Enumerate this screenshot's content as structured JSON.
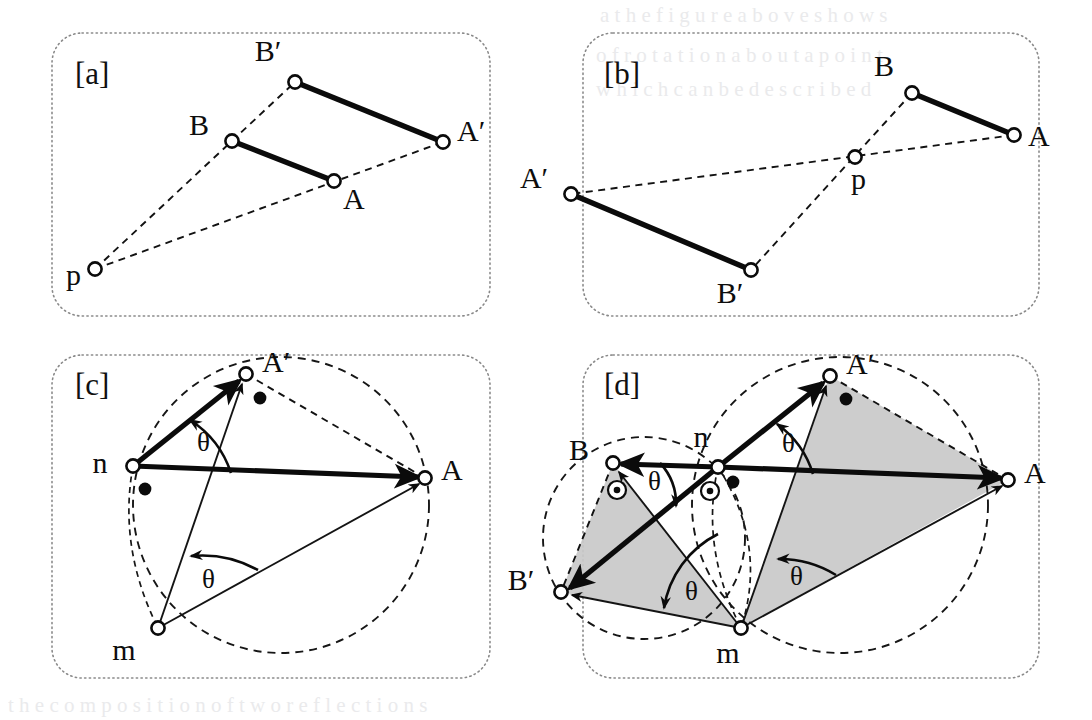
{
  "figure": {
    "canvas": {
      "width": 1092,
      "height": 720,
      "background": "#ffffff"
    },
    "style": {
      "panel_border": "#8a8a8a",
      "stroke": "#0b0b0b",
      "shade_fill": "#c9c9c9",
      "node_fill": "#ffffff"
    }
  },
  "panels": [
    {
      "id": "a",
      "tag": "[a]",
      "tag_pos": {
        "x": 75,
        "y": 84
      },
      "frame": {
        "x": 52,
        "y": 33,
        "w": 438,
        "h": 283,
        "r": 30
      },
      "description": "Central similarity / homothety from point p mapping segment AB to A'B'",
      "points": [
        {
          "name": "B'",
          "label": "B′",
          "x": 295,
          "y": 82,
          "label_x": 268,
          "label_y": 61,
          "marker": "open"
        },
        {
          "name": "B",
          "label": "B",
          "x": 232,
          "y": 141,
          "label_x": 199,
          "label_y": 135,
          "marker": "open"
        },
        {
          "name": "A'",
          "label": "A′",
          "x": 443,
          "y": 142,
          "label_x": 457,
          "label_y": 141,
          "marker": "open"
        },
        {
          "name": "A",
          "label": "A",
          "x": 334,
          "y": 181,
          "label_x": 343,
          "label_y": 209,
          "marker": "open"
        },
        {
          "name": "p",
          "label": "p",
          "x": 95,
          "y": 269,
          "label_x": 66,
          "label_y": 285,
          "marker": "open"
        }
      ],
      "solid_segments": [
        {
          "from": "B'",
          "to": "A'"
        },
        {
          "from": "B",
          "to": "A"
        }
      ],
      "dashed_segments": [
        {
          "from": "p",
          "to": "B'"
        },
        {
          "from": "p",
          "to": "A'"
        }
      ]
    },
    {
      "id": "b",
      "tag": "[b]",
      "tag_pos": {
        "x": 604,
        "y": 84
      },
      "frame": {
        "x": 583,
        "y": 33,
        "w": 456,
        "h": 283,
        "r": 30
      },
      "description": "Point reflection (180 degree rotation) about p mapping AB to A'B'",
      "points": [
        {
          "name": "B",
          "label": "B",
          "x": 912,
          "y": 93,
          "label_x": 884,
          "label_y": 76,
          "marker": "open"
        },
        {
          "name": "A",
          "label": "A",
          "x": 1014,
          "y": 135,
          "label_x": 1028,
          "label_y": 146,
          "marker": "open"
        },
        {
          "name": "p",
          "label": "p",
          "x": 855,
          "y": 157,
          "label_x": 851,
          "label_y": 189,
          "marker": "open"
        },
        {
          "name": "A'",
          "label": "A′",
          "x": 571,
          "y": 194,
          "label_x": 534,
          "label_y": 188,
          "marker": "open"
        },
        {
          "name": "B'",
          "label": "B′",
          "x": 751,
          "y": 270,
          "label_x": 730,
          "label_y": 303,
          "marker": "open"
        }
      ],
      "solid_segments": [
        {
          "from": "B",
          "to": "A"
        },
        {
          "from": "A'",
          "to": "B'"
        }
      ],
      "dashed_segments": [
        {
          "from": "A",
          "to": "A'"
        },
        {
          "from": "B",
          "to": "B'"
        }
      ]
    },
    {
      "id": "c",
      "tag": "[c]",
      "tag_pos": {
        "x": 75,
        "y": 395
      },
      "frame": {
        "x": 52,
        "y": 355,
        "w": 438,
        "h": 323,
        "r": 30
      },
      "description": "Inscribed angle theta at n and m subtending chord A A' on a circle",
      "points": [
        {
          "name": "A'",
          "label": "A′",
          "x": 246,
          "y": 374,
          "label_x": 262,
          "label_y": 372,
          "marker": "open"
        },
        {
          "name": "n",
          "label": "n",
          "x": 133,
          "y": 466,
          "label_x": 100,
          "label_y": 473,
          "marker": "open"
        },
        {
          "name": "A",
          "label": "A",
          "x": 425,
          "y": 478,
          "label_x": 441,
          "label_y": 480,
          "marker": "open"
        },
        {
          "name": "m",
          "label": "m",
          "x": 158,
          "y": 628,
          "label_x": 124,
          "label_y": 660,
          "marker": "open"
        }
      ],
      "dots": [
        {
          "x": 260,
          "y": 398
        },
        {
          "x": 145,
          "y": 489
        }
      ],
      "circle": {
        "cx": 281,
        "cy": 505,
        "r": 148
      },
      "vectors": [
        {
          "from": "n",
          "to": "A'"
        },
        {
          "from": "n",
          "to": "A"
        },
        {
          "from": "m",
          "to": "A'"
        },
        {
          "from": "m",
          "to": "A"
        }
      ],
      "dashed_segments": [
        {
          "from": "A'",
          "to": "A"
        }
      ],
      "theta_labels": [
        {
          "text": "θ",
          "x": 197,
          "y": 451
        },
        {
          "text": "θ",
          "x": 202,
          "y": 588
        }
      ]
    },
    {
      "id": "d",
      "tag": "[d]",
      "tag_pos": {
        "x": 604,
        "y": 395
      },
      "frame": {
        "x": 583,
        "y": 355,
        "w": 456,
        "h": 323,
        "r": 30
      },
      "description": "Two circles through n and m; rotation by theta maps B to B' and A to A'; shaded congruent triangles",
      "points": [
        {
          "name": "A'",
          "label": "A′",
          "x": 830,
          "y": 376,
          "label_x": 846,
          "label_y": 374,
          "marker": "open"
        },
        {
          "name": "B",
          "label": "B",
          "x": 613,
          "y": 463,
          "label_x": 579,
          "label_y": 460,
          "marker": "open"
        },
        {
          "name": "n",
          "label": "n",
          "x": 718,
          "y": 467,
          "label_x": 701,
          "label_y": 447,
          "marker": "open"
        },
        {
          "name": "A",
          "label": "A",
          "x": 1008,
          "y": 480,
          "label_x": 1024,
          "label_y": 483,
          "marker": "open"
        },
        {
          "name": "B'",
          "label": "B′",
          "x": 561,
          "y": 592,
          "label_x": 521,
          "label_y": 590,
          "marker": "open"
        },
        {
          "name": "m",
          "label": "m",
          "x": 741,
          "y": 628,
          "label_x": 728,
          "label_y": 663,
          "marker": "open"
        }
      ],
      "dots": [
        {
          "x": 846,
          "y": 399
        },
        {
          "x": 733,
          "y": 482
        }
      ],
      "ring_dots": [
        {
          "x": 617,
          "y": 490
        },
        {
          "x": 710,
          "y": 491
        }
      ],
      "circles": [
        {
          "cx": 840,
          "cy": 505,
          "r": 148,
          "name": "right-circle"
        },
        {
          "cx": 644,
          "cy": 538,
          "r": 101,
          "name": "left-circle"
        }
      ],
      "shaded_triangles": [
        {
          "vertices": [
            "A'",
            "A",
            "m"
          ],
          "name": "right-shaded-triangle"
        },
        {
          "vertices": [
            "B",
            "B'",
            "m"
          ],
          "name": "left-shaded-triangle"
        }
      ],
      "theta_labels": [
        {
          "text": "θ",
          "x": 782,
          "y": 452
        },
        {
          "text": "θ",
          "x": 648,
          "y": 490
        },
        {
          "text": "θ",
          "x": 685,
          "y": 600
        },
        {
          "text": "θ",
          "x": 790,
          "y": 585
        }
      ]
    }
  ],
  "glyphs": {
    "theta": "θ",
    "prime": "′"
  }
}
